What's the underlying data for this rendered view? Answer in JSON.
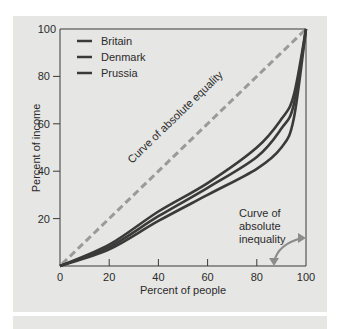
{
  "chart_data": {
    "type": "line",
    "title": "",
    "xlabel": "Percent of people",
    "ylabel": "Percent of income",
    "xlim": [
      0,
      100
    ],
    "ylim": [
      0,
      100
    ],
    "x_ticks": [
      "0",
      "20",
      "40",
      "60",
      "80",
      "100"
    ],
    "y_ticks": [
      "20",
      "40",
      "60",
      "80",
      "100"
    ],
    "grid": false,
    "legend_position": "upper-left",
    "legend": [
      "Britain",
      "Denmark",
      "Prussia"
    ],
    "x": [
      0,
      20,
      40,
      60,
      80,
      90,
      95,
      100
    ],
    "series": [
      {
        "name": "Britain",
        "values": [
          0,
          9,
          23,
          35,
          50,
          62,
          72,
          100
        ]
      },
      {
        "name": "Denmark",
        "values": [
          0,
          8,
          21,
          33,
          46,
          58,
          68,
          100
        ]
      },
      {
        "name": "Prussia",
        "values": [
          0,
          7,
          19,
          30,
          41,
          50,
          62,
          100
        ]
      },
      {
        "name": "Curve of absolute equality",
        "values": [
          0,
          20,
          40,
          60,
          80,
          90,
          95,
          100
        ],
        "style": "dashed"
      }
    ],
    "annotations": [
      {
        "text": "Curve of absolute equality",
        "position": "along diagonal"
      },
      {
        "text": "Curve of absolute inequality",
        "position": "lower-right, with arrow pointing to bottom and right axes"
      }
    ],
    "colors": {
      "curves": "#3a3a3a",
      "equality_line": "#9a9a9a",
      "arrow": "#8c8c8c",
      "panel_bg": "#e6e6e4"
    }
  },
  "labels": {
    "x_axis_title": "Percent of people",
    "y_axis_title": "Percent of income",
    "x_ticks": [
      "0",
      "20",
      "40",
      "60",
      "80",
      "100"
    ],
    "y_ticks": [
      "20",
      "40",
      "60",
      "80",
      "100"
    ],
    "legend": [
      "Britain",
      "Denmark",
      "Prussia"
    ],
    "equality_label": "Curve of absolute equality",
    "inequality_label_lines": [
      "Curve of",
      "absolute",
      "inequality"
    ]
  }
}
